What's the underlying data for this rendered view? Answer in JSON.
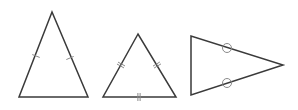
{
  "diagram": {
    "title": "",
    "stroke_color": "#3a3a3a",
    "mark_color": "#8a8a8a",
    "triangles": [
      {
        "name": "isosceles-triangle",
        "type": "isosceles",
        "points": [
          [
            52,
            12
          ],
          [
            19,
            97
          ],
          [
            88,
            97
          ]
        ],
        "tick_marks": [
          {
            "side": "left",
            "count": 1,
            "at": [
              36,
              56
            ]
          },
          {
            "side": "right",
            "count": 1,
            "at": [
              70,
              58
            ]
          }
        ]
      },
      {
        "name": "equilateral-triangle",
        "type": "equilateral",
        "points": [
          [
            138,
            34
          ],
          [
            103,
            97
          ],
          [
            176,
            97
          ]
        ],
        "tick_marks": [
          {
            "side": "left",
            "count": 2,
            "at": [
              121,
              65
            ]
          },
          {
            "side": "right",
            "count": 2,
            "at": [
              157,
              65
            ]
          },
          {
            "side": "bottom",
            "count": 2,
            "at": [
              139,
              97
            ]
          }
        ]
      },
      {
        "name": "isosceles-triangle-circle-marks",
        "type": "isosceles",
        "points": [
          [
            191,
            36
          ],
          [
            191,
            95
          ],
          [
            283,
            65
          ]
        ],
        "circle_marks": [
          {
            "side": "top",
            "at": [
              227,
              48
            ]
          },
          {
            "side": "bottom",
            "at": [
              227,
              83
            ]
          }
        ]
      }
    ]
  }
}
